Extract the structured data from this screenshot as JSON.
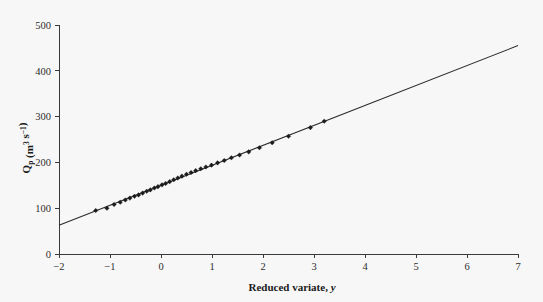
{
  "figure": {
    "background_color": "#f7f7f7",
    "line_color": "#2b2b2b",
    "marker_color": "#1c1c1c",
    "axis_color": "#3a3a3a"
  },
  "axes": {
    "x_title_main": "Reduced variate,",
    "x_title_var": "y",
    "y_title_q": "Q",
    "y_title_sub": "p",
    "y_title_open": " (m",
    "y_title_sup3": "3",
    "y_title_s": " s",
    "y_title_supm1": "−1",
    "y_title_close": ")",
    "x_ticks": [
      "−2",
      "−1",
      "0",
      "1",
      "2",
      "3",
      "4",
      "5",
      "6",
      "7"
    ],
    "y_ticks": [
      "0",
      "100",
      "200",
      "300",
      "400",
      "500"
    ]
  },
  "chart_data": {
    "type": "scatter",
    "title": "",
    "xlabel": "Reduced variate, y",
    "ylabel": "Qp (m3 s-1)",
    "xlim": [
      -2,
      7
    ],
    "ylim": [
      0,
      500
    ],
    "x_ticks": [
      -2,
      -1,
      0,
      1,
      2,
      3,
      4,
      5,
      6,
      7
    ],
    "y_ticks": [
      0,
      100,
      200,
      300,
      400,
      500
    ],
    "grid": false,
    "legend": "none",
    "series": [
      {
        "name": "Gumbel fit line",
        "type": "line",
        "marker": "none",
        "points": [
          [
            -2,
            63
          ],
          [
            7,
            455
          ]
        ]
      },
      {
        "name": "Annual maximum flood peaks",
        "type": "scatter",
        "marker": "diamond",
        "x": [
          -1.28,
          -1.06,
          -0.92,
          -0.8,
          -0.7,
          -0.61,
          -0.52,
          -0.44,
          -0.36,
          -0.28,
          -0.21,
          -0.13,
          -0.06,
          0.02,
          0.09,
          0.17,
          0.25,
          0.33,
          0.41,
          0.5,
          0.59,
          0.68,
          0.78,
          0.88,
          0.99,
          1.11,
          1.24,
          1.38,
          1.54,
          1.72,
          1.93,
          2.18,
          2.5,
          2.93,
          3.2
        ],
        "y": [
          95,
          100,
          108,
          113,
          118,
          122,
          126,
          129,
          133,
          137,
          140,
          144,
          147,
          151,
          154,
          158,
          162,
          166,
          170,
          174,
          178,
          182,
          186,
          190,
          194,
          199,
          204,
          210,
          216,
          223,
          232,
          243,
          257,
          276,
          290
        ]
      }
    ]
  }
}
